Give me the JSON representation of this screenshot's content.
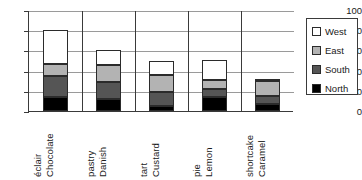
{
  "chart_data": {
    "type": "bar",
    "subtype": "stacked-column",
    "title": "",
    "xlabel": "",
    "ylabel": "",
    "ylim": [
      0,
      100
    ],
    "yticks": [
      0,
      20,
      40,
      60,
      80,
      100
    ],
    "grid": true,
    "legend_position": "right",
    "categories": [
      "Chocolate éclair",
      "Danish pastry",
      "Custard tart",
      "Lemon pie",
      "Caramel shortcake"
    ],
    "category_lines": [
      [
        "Chocolate",
        "éclair"
      ],
      [
        "Danish",
        "pastry"
      ],
      [
        "Custard",
        "tart"
      ],
      [
        "Lemon",
        "pie"
      ],
      [
        "Caramel",
        "shortcake"
      ]
    ],
    "series": [
      {
        "name": "North",
        "color": "#000000",
        "values": [
          14,
          11.5,
          5,
          13.5,
          7
        ]
      },
      {
        "name": "South",
        "color": "#555555",
        "values": [
          20.5,
          17,
          14,
          8,
          7.5
        ]
      },
      {
        "name": "East",
        "color": "#b3b3b3",
        "values": [
          12.5,
          17,
          17,
          9.5,
          15.5
        ]
      },
      {
        "name": "West",
        "color": "#ffffff",
        "values": [
          33,
          14.5,
          14,
          20,
          1
        ]
      }
    ],
    "stack_totals": [
      80,
      60,
      50,
      51,
      31
    ],
    "stack_order": [
      "North",
      "South",
      "East",
      "West"
    ]
  },
  "legend": {
    "items": [
      {
        "label": "West",
        "color": "#ffffff",
        "icon": "legend-swatch-west"
      },
      {
        "label": "East",
        "color": "#b3b3b3",
        "icon": "legend-swatch-east"
      },
      {
        "label": "South",
        "color": "#555555",
        "icon": "legend-swatch-south"
      },
      {
        "label": "North",
        "color": "#000000",
        "icon": "legend-swatch-north"
      }
    ]
  },
  "axis": {
    "y_tick_labels": [
      "100",
      "80",
      "60",
      "40",
      "20",
      "0"
    ]
  }
}
